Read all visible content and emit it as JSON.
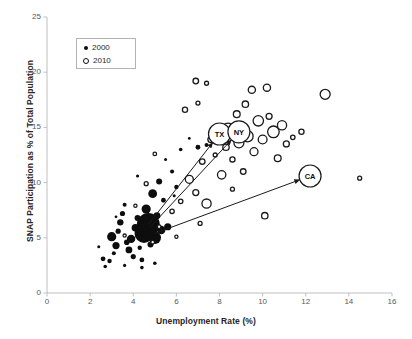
{
  "chart_data": {
    "type": "scatter",
    "title": "",
    "xlabel": "Unemployment Rate (%)",
    "ylabel": "SNAP Participation as % of Total Population",
    "xlim": [
      0,
      16
    ],
    "ylim": [
      0,
      25
    ],
    "xticks": [
      0,
      2,
      4,
      6,
      8,
      10,
      12,
      14,
      16
    ],
    "yticks": [
      0,
      5,
      10,
      15,
      20,
      25
    ],
    "grid": false,
    "legend_position": "top-left",
    "legend": [
      {
        "name": "2000",
        "marker": "filled-circle"
      },
      {
        "name": "2010",
        "marker": "open-circle"
      }
    ],
    "bubble_note": "Marker area scales with state population",
    "series": [
      {
        "name": "2000",
        "marker": "filled-circle",
        "color": "#0d0d0d",
        "points": [
          {
            "x": 2.6,
            "y": 3.1,
            "r": 2.4
          },
          {
            "x": 2.9,
            "y": 2.9,
            "r": 2.2
          },
          {
            "x": 3.1,
            "y": 3.6,
            "r": 2.0
          },
          {
            "x": 3.2,
            "y": 4.3,
            "r": 3.6
          },
          {
            "x": 3.0,
            "y": 5.1,
            "r": 4.6
          },
          {
            "x": 3.3,
            "y": 5.6,
            "r": 2.6
          },
          {
            "x": 3.4,
            "y": 6.4,
            "r": 3.2
          },
          {
            "x": 3.5,
            "y": 7.2,
            "r": 2.6
          },
          {
            "x": 3.6,
            "y": 8.0,
            "r": 2.0
          },
          {
            "x": 3.7,
            "y": 4.6,
            "r": 2.8
          },
          {
            "x": 3.8,
            "y": 3.9,
            "r": 3.4
          },
          {
            "x": 3.9,
            "y": 4.9,
            "r": 4.2
          },
          {
            "x": 4.0,
            "y": 3.3,
            "r": 2.6
          },
          {
            "x": 4.1,
            "y": 5.9,
            "r": 3.8
          },
          {
            "x": 4.2,
            "y": 6.8,
            "r": 3.0
          },
          {
            "x": 4.3,
            "y": 4.1,
            "r": 2.2
          },
          {
            "x": 4.4,
            "y": 3.0,
            "r": 2.4
          },
          {
            "x": 4.5,
            "y": 5.4,
            "r": 9.5
          },
          {
            "x": 4.6,
            "y": 7.6,
            "r": 4.6
          },
          {
            "x": 4.7,
            "y": 6.2,
            "r": 11.5
          },
          {
            "x": 4.8,
            "y": 4.4,
            "r": 3.0
          },
          {
            "x": 4.9,
            "y": 9.0,
            "r": 4.4
          },
          {
            "x": 5.0,
            "y": 5.0,
            "r": 6.2
          },
          {
            "x": 5.1,
            "y": 7.0,
            "r": 3.4
          },
          {
            "x": 5.2,
            "y": 10.1,
            "r": 3.0
          },
          {
            "x": 5.3,
            "y": 5.7,
            "r": 4.2
          },
          {
            "x": 5.4,
            "y": 8.4,
            "r": 2.4
          },
          {
            "x": 5.6,
            "y": 6.0,
            "r": 3.6
          },
          {
            "x": 5.8,
            "y": 11.0,
            "r": 2.0
          },
          {
            "x": 6.0,
            "y": 9.6,
            "r": 2.2
          },
          {
            "x": 4.4,
            "y": 2.3,
            "r": 1.8
          },
          {
            "x": 3.6,
            "y": 2.5,
            "r": 1.6
          },
          {
            "x": 2.7,
            "y": 2.4,
            "r": 1.8
          },
          {
            "x": 5.0,
            "y": 2.7,
            "r": 1.8
          },
          {
            "x": 6.2,
            "y": 13.0,
            "r": 1.8
          },
          {
            "x": 6.6,
            "y": 14.0,
            "r": 1.4
          },
          {
            "x": 7.0,
            "y": 13.2,
            "r": 2.4
          },
          {
            "x": 5.5,
            "y": 12.1,
            "r": 1.5
          },
          {
            "x": 4.2,
            "y": 10.6,
            "r": 1.6
          },
          {
            "x": 3.2,
            "y": 6.9,
            "r": 1.4
          },
          {
            "x": 2.4,
            "y": 4.2,
            "r": 1.5
          },
          {
            "x": 7.4,
            "y": 13.4,
            "r": 2.0
          },
          {
            "x": 7.8,
            "y": 13.6,
            "r": 1.6
          },
          {
            "x": 5.9,
            "y": 8.8,
            "r": 1.5
          }
        ]
      },
      {
        "name": "2010",
        "marker": "open-circle",
        "color": "#1a1a1a",
        "points": [
          {
            "x": 6.2,
            "y": 8.3,
            "r": 2.2
          },
          {
            "x": 6.6,
            "y": 10.3,
            "r": 4.0
          },
          {
            "x": 6.9,
            "y": 9.1,
            "r": 3.0
          },
          {
            "x": 7.2,
            "y": 11.9,
            "r": 2.8
          },
          {
            "x": 7.4,
            "y": 8.1,
            "r": 4.6
          },
          {
            "x": 7.6,
            "y": 13.9,
            "r": 3.0
          },
          {
            "x": 7.8,
            "y": 12.5,
            "r": 2.0
          },
          {
            "x": 8.0,
            "y": 14.4,
            "r": 6.0
          },
          {
            "x": 8.1,
            "y": 10.7,
            "r": 4.2
          },
          {
            "x": 8.3,
            "y": 13.2,
            "r": 3.2
          },
          {
            "x": 8.4,
            "y": 14.8,
            "r": 6.4
          },
          {
            "x": 8.6,
            "y": 12.1,
            "r": 2.6
          },
          {
            "x": 8.8,
            "y": 16.2,
            "r": 3.4
          },
          {
            "x": 8.9,
            "y": 13.6,
            "r": 5.0
          },
          {
            "x": 9.0,
            "y": 15.0,
            "r": 4.0
          },
          {
            "x": 9.2,
            "y": 17.1,
            "r": 3.2
          },
          {
            "x": 9.3,
            "y": 14.2,
            "r": 5.6
          },
          {
            "x": 9.5,
            "y": 18.4,
            "r": 3.6
          },
          {
            "x": 9.6,
            "y": 12.8,
            "r": 4.0
          },
          {
            "x": 9.8,
            "y": 15.6,
            "r": 5.2
          },
          {
            "x": 10.0,
            "y": 13.9,
            "r": 4.4
          },
          {
            "x": 10.2,
            "y": 18.6,
            "r": 3.6
          },
          {
            "x": 10.3,
            "y": 16.0,
            "r": 3.0
          },
          {
            "x": 10.5,
            "y": 14.6,
            "r": 5.8
          },
          {
            "x": 10.7,
            "y": 12.2,
            "r": 3.4
          },
          {
            "x": 10.9,
            "y": 15.2,
            "r": 4.6
          },
          {
            "x": 11.1,
            "y": 13.5,
            "r": 3.0
          },
          {
            "x": 11.4,
            "y": 14.1,
            "r": 2.2
          },
          {
            "x": 11.8,
            "y": 14.6,
            "r": 2.6
          },
          {
            "x": 12.9,
            "y": 18.0,
            "r": 5.0
          },
          {
            "x": 14.5,
            "y": 10.4,
            "r": 2.0
          },
          {
            "x": 10.1,
            "y": 7.0,
            "r": 3.2
          },
          {
            "x": 7.1,
            "y": 6.3,
            "r": 2.0
          },
          {
            "x": 5.8,
            "y": 7.4,
            "r": 2.2
          },
          {
            "x": 5.2,
            "y": 6.0,
            "r": 1.8
          },
          {
            "x": 4.6,
            "y": 9.9,
            "r": 2.0
          },
          {
            "x": 4.1,
            "y": 7.9,
            "r": 1.6
          },
          {
            "x": 5.0,
            "y": 12.6,
            "r": 1.8
          },
          {
            "x": 6.4,
            "y": 16.6,
            "r": 2.6
          },
          {
            "x": 7.0,
            "y": 17.2,
            "r": 2.0
          },
          {
            "x": 6.9,
            "y": 19.2,
            "r": 2.8
          },
          {
            "x": 7.4,
            "y": 19.0,
            "r": 2.0
          },
          {
            "x": 3.6,
            "y": 5.2,
            "r": 1.6
          },
          {
            "x": 4.9,
            "y": 4.6,
            "r": 1.8
          },
          {
            "x": 6.0,
            "y": 5.1,
            "r": 1.6
          },
          {
            "x": 8.6,
            "y": 9.4,
            "r": 2.0
          },
          {
            "x": 9.1,
            "y": 11.0,
            "r": 2.8
          }
        ]
      }
    ],
    "annotations": [
      {
        "label": "TX",
        "x": 8.0,
        "y": 14.4,
        "arrow_from_x": 4.7,
        "arrow_from_y": 6.2
      },
      {
        "label": "NY",
        "x": 8.9,
        "y": 14.6,
        "arrow_from_x": 4.8,
        "arrow_from_y": 6.0
      },
      {
        "label": "CA",
        "x": 12.2,
        "y": 10.6,
        "arrow_from_x": 5.0,
        "arrow_from_y": 5.4
      }
    ]
  }
}
